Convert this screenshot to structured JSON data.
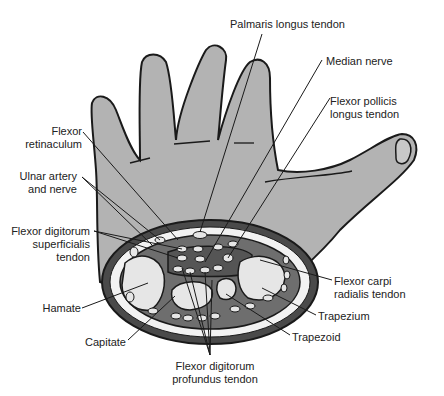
{
  "labels": {
    "palmaris_longus": "Palmaris longus tendon",
    "median_nerve": "Median nerve",
    "fpl_1": "Flexor pollicis",
    "fpl_2": "longus tendon",
    "flexor_ret_1": "Flexor",
    "flexor_ret_2": "retinaculum",
    "ulnar_1": "Ulnar artery",
    "ulnar_2": "and nerve",
    "fds_1": "Flexor digitorum",
    "fds_2": "superficialis",
    "fds_3": "tendon",
    "hamate": "Hamate",
    "capitate": "Capitate",
    "fcr_1": "Flexor carpi",
    "fcr_2": "radialis tendon",
    "trapezium": "Trapezium",
    "trapezoid": "Trapezoid",
    "fdp_1": "Flexor digitorum",
    "fdp_2": "profundus tendon"
  },
  "colors": {
    "hand_fill": "#b3b3b3",
    "outline": "#1a1a1a",
    "bone_fill": "#e6e6e6",
    "tunnel_fill": "#6e6e6e",
    "fat_fill": "#f2f2f2"
  }
}
